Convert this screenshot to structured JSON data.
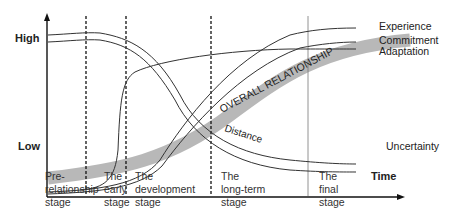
{
  "diagram": {
    "y_axis": {
      "high_label": "High",
      "low_label": "Low"
    },
    "x_axis": {
      "label": "Time"
    },
    "stages": [
      {
        "label": "Pre-\nrelationship\nstage"
      },
      {
        "label": "The\nearly\nstage"
      },
      {
        "label": "The\ndevelopment\nstage"
      },
      {
        "label": "The\nlong-term\nstage"
      },
      {
        "label": "The\nfinal\nstage"
      }
    ],
    "curves": {
      "experience": "Experience",
      "commitment": "Commitment",
      "adaptation": "Adaptation",
      "uncertainty": "Uncertainty",
      "distance": "Distance",
      "overall": "OVERALL RELATIONSHIP"
    },
    "colors": {
      "line": "#333333",
      "band": "#b8b8b8",
      "axis": "#111111"
    }
  }
}
